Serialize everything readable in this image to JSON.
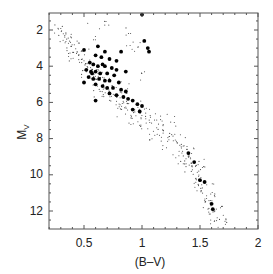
{
  "chart_data": {
    "type": "scatter",
    "title": "",
    "xlabel": "(B–V)",
    "ylabel": "M",
    "ylabel_subscript": "V",
    "xlim": [
      0.2,
      2.0
    ],
    "ylim": [
      13.0,
      1.05
    ],
    "y_inverted": true,
    "grid": false,
    "legend": null,
    "x_ticks": [
      0.5,
      1,
      1.5,
      2
    ],
    "x_tick_labels": [
      "0.5",
      "1",
      "1.5",
      "2"
    ],
    "y_ticks": [
      2,
      4,
      6,
      8,
      10,
      12
    ],
    "y_tick_labels": [
      "2",
      "4",
      "6",
      "8",
      "10",
      "12"
    ],
    "series": [
      {
        "name": "field stars (small points)",
        "marker": "small-dot",
        "description": "main sequence band from (0.25,1.8) through (1.0,6.5) to (1.6,12.5)",
        "points": [
          [
            0.28,
            1.9
          ],
          [
            0.3,
            2.1
          ],
          [
            0.33,
            2.4
          ],
          [
            0.35,
            2.6
          ],
          [
            0.38,
            2.8
          ],
          [
            0.4,
            3.0
          ],
          [
            0.42,
            3.1
          ],
          [
            0.44,
            3.3
          ],
          [
            0.46,
            3.4
          ],
          [
            0.48,
            3.6
          ],
          [
            0.5,
            3.7
          ],
          [
            0.52,
            3.9
          ],
          [
            0.55,
            4.1
          ],
          [
            0.57,
            4.3
          ],
          [
            0.6,
            4.5
          ],
          [
            0.62,
            4.7
          ],
          [
            0.65,
            4.9
          ],
          [
            0.67,
            5.1
          ],
          [
            0.7,
            5.3
          ],
          [
            0.72,
            5.4
          ],
          [
            0.75,
            5.6
          ],
          [
            0.78,
            5.8
          ],
          [
            0.8,
            5.9
          ],
          [
            0.83,
            6.1
          ],
          [
            0.86,
            6.3
          ],
          [
            0.9,
            6.4
          ],
          [
            0.93,
            6.6
          ],
          [
            0.96,
            6.8
          ],
          [
            1.0,
            6.9
          ],
          [
            1.04,
            7.1
          ],
          [
            1.08,
            7.3
          ],
          [
            1.12,
            7.5
          ],
          [
            1.16,
            7.6
          ],
          [
            1.2,
            7.8
          ],
          [
            1.25,
            8.0
          ],
          [
            1.3,
            8.2
          ],
          [
            1.33,
            8.4
          ],
          [
            1.36,
            8.7
          ],
          [
            1.38,
            8.9
          ],
          [
            1.4,
            9.1
          ],
          [
            1.42,
            9.4
          ],
          [
            1.44,
            9.6
          ],
          [
            1.46,
            9.9
          ],
          [
            1.48,
            10.1
          ],
          [
            1.5,
            10.4
          ],
          [
            1.52,
            10.7
          ],
          [
            1.54,
            11.0
          ],
          [
            1.56,
            11.3
          ],
          [
            1.58,
            11.6
          ],
          [
            1.6,
            11.9
          ],
          [
            1.62,
            12.2
          ],
          [
            1.63,
            12.5
          ],
          [
            0.3,
            2.5
          ],
          [
            0.36,
            2.3
          ],
          [
            0.4,
            3.5
          ],
          [
            0.45,
            2.9
          ],
          [
            0.5,
            4.3
          ],
          [
            0.53,
            3.4
          ],
          [
            0.6,
            5.0
          ],
          [
            0.64,
            4.2
          ],
          [
            0.7,
            5.8
          ],
          [
            0.74,
            4.9
          ],
          [
            0.8,
            6.5
          ],
          [
            0.84,
            5.6
          ],
          [
            0.9,
            7.0
          ],
          [
            0.95,
            6.2
          ],
          [
            1.0,
            7.5
          ],
          [
            1.05,
            6.6
          ],
          [
            1.1,
            8.0
          ],
          [
            1.15,
            7.2
          ],
          [
            1.2,
            8.4
          ],
          [
            1.25,
            7.6
          ],
          [
            1.3,
            8.8
          ],
          [
            1.35,
            8.1
          ],
          [
            1.4,
            9.6
          ],
          [
            1.43,
            8.8
          ],
          [
            1.48,
            10.6
          ],
          [
            1.5,
            9.7
          ],
          [
            1.55,
            11.5
          ],
          [
            1.58,
            10.8
          ],
          [
            1.65,
            12.8
          ],
          [
            1.7,
            12.3
          ],
          [
            1.45,
            9.2
          ],
          [
            1.35,
            9.5
          ],
          [
            1.52,
            9.4
          ],
          [
            1.6,
            11.2
          ],
          [
            1.66,
            11.8
          ],
          [
            1.72,
            12.8
          ],
          [
            0.85,
            5.2
          ],
          [
            0.9,
            3.0
          ],
          [
            0.88,
            2.2
          ],
          [
            0.7,
            1.7
          ],
          [
            0.55,
            1.3
          ],
          [
            0.6,
            2.2
          ],
          [
            0.95,
            2.8
          ],
          [
            1.02,
            4.5
          ],
          [
            1.18,
            7.0
          ],
          [
            1.28,
            7.0
          ],
          [
            1.1,
            6.9
          ],
          [
            0.62,
            5.4
          ]
        ]
      },
      {
        "name": "selected stars (large points)",
        "marker": "large-dot",
        "points": [
          [
            1.0,
            1.15
          ],
          [
            1.02,
            2.6
          ],
          [
            1.05,
            3.0
          ],
          [
            1.06,
            3.2
          ],
          [
            0.68,
            3.2
          ],
          [
            0.6,
            3.4
          ],
          [
            0.65,
            3.5
          ],
          [
            0.72,
            3.6
          ],
          [
            0.78,
            3.7
          ],
          [
            0.55,
            3.8
          ],
          [
            0.58,
            3.9
          ],
          [
            0.62,
            4.0
          ],
          [
            0.68,
            4.0
          ],
          [
            0.74,
            4.1
          ],
          [
            0.52,
            4.2
          ],
          [
            0.56,
            4.3
          ],
          [
            0.6,
            4.3
          ],
          [
            0.64,
            4.4
          ],
          [
            0.7,
            4.4
          ],
          [
            0.76,
            4.5
          ],
          [
            0.54,
            4.6
          ],
          [
            0.58,
            4.7
          ],
          [
            0.63,
            4.7
          ],
          [
            0.68,
            4.8
          ],
          [
            0.72,
            4.8
          ],
          [
            0.8,
            4.9
          ],
          [
            0.6,
            5.0
          ],
          [
            0.66,
            5.1
          ],
          [
            0.7,
            5.2
          ],
          [
            0.75,
            5.2
          ],
          [
            0.82,
            5.3
          ],
          [
            0.86,
            5.4
          ],
          [
            0.72,
            5.5
          ],
          [
            0.78,
            5.6
          ],
          [
            0.84,
            5.7
          ],
          [
            0.88,
            5.8
          ],
          [
            0.92,
            5.9
          ],
          [
            0.96,
            6.1
          ],
          [
            1.0,
            6.2
          ],
          [
            0.92,
            6.4
          ],
          [
            0.98,
            6.5
          ],
          [
            0.6,
            5.9
          ],
          [
            0.5,
            4.9
          ],
          [
            0.5,
            3.1
          ],
          [
            0.62,
            2.9
          ],
          [
            0.82,
            3.2
          ],
          [
            0.86,
            4.3
          ],
          [
            0.78,
            4.2
          ],
          [
            0.66,
            3.9
          ],
          [
            0.57,
            4.4
          ],
          [
            1.5,
            10.3
          ],
          [
            1.54,
            10.4
          ],
          [
            1.6,
            11.6
          ],
          [
            1.61,
            11.9
          ],
          [
            1.45,
            9.3
          ],
          [
            1.4,
            8.8
          ]
        ]
      }
    ]
  },
  "axes": {
    "xlabel": "(B–V)",
    "ylabel_main": "M",
    "ylabel_sub": "V",
    "x_tick_labels": [
      "0.5",
      "1",
      "1.5",
      "2"
    ],
    "y_tick_labels": [
      "2",
      "4",
      "6",
      "8",
      "10",
      "12"
    ]
  },
  "colors": {
    "axis": "#555555",
    "small_dot": "#444444",
    "large_dot": "#000000",
    "text": "#222222"
  }
}
